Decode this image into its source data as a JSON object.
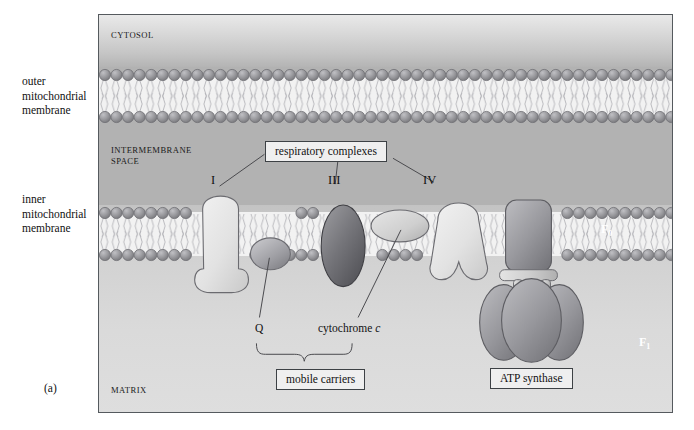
{
  "figure": {
    "panel_letter": "(a)",
    "compartments": [
      {
        "id": "cytosol",
        "label": "CYTOSOL"
      },
      {
        "id": "intermembrane-space",
        "label": "INTERMEMBRANE\nSPACE"
      },
      {
        "id": "matrix",
        "label": "MATRIX"
      }
    ],
    "margin_labels": [
      {
        "id": "outer-membrane",
        "label": "outer\nmitochondrial\nmembrane"
      },
      {
        "id": "inner-membrane",
        "label": "inner\nmitochondrial\nmembrane"
      }
    ],
    "complex_numerals": [
      {
        "id": "complex-i",
        "label": "I"
      },
      {
        "id": "complex-iii",
        "label": "III"
      },
      {
        "id": "complex-iv",
        "label": "IV"
      }
    ],
    "carriers": [
      {
        "id": "ubiquinone",
        "label": "Q"
      },
      {
        "id": "cytochrome-c",
        "label_prefix": "cytochrome ",
        "label_italic": "c"
      }
    ],
    "callouts": [
      {
        "id": "respiratory-complexes",
        "label": "respiratory complexes"
      },
      {
        "id": "mobile-carriers",
        "label": "mobile carriers"
      },
      {
        "id": "atp-synthase",
        "label": "ATP synthase"
      }
    ],
    "atp_synthase_subunits": [
      {
        "id": "f0",
        "label": "F",
        "subscript": "0"
      },
      {
        "id": "f1",
        "label": "F",
        "subscript": "1"
      }
    ],
    "colors": {
      "frame_border": "#555a5e",
      "cytosol_top": "#e9e9e9",
      "intermembrane_space": "#b2b2b2",
      "matrix": "#dadada",
      "lipid_head": "#8f8f93",
      "lipid_tail": "#b7b7bb",
      "complex_light": "#e3e3e3",
      "complex_dark": "#6e6e72",
      "callout_bg": "#efefef",
      "callout_border": "#3d4145",
      "leader_line": "#4a4a4e"
    }
  }
}
